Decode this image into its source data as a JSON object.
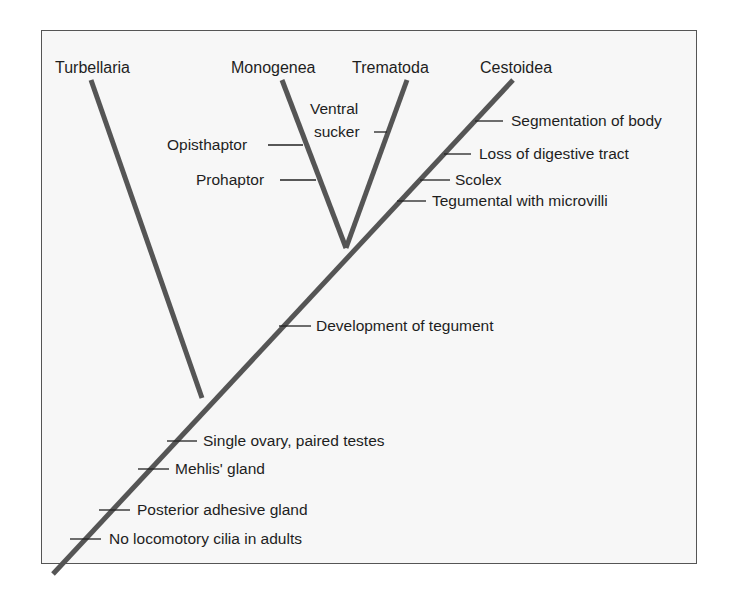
{
  "diagram": {
    "type": "cladogram",
    "colors": {
      "branch": "#555555",
      "tick": "#222222",
      "background": "#f7f7f7",
      "border": "#555555"
    },
    "taxa": [
      {
        "id": "turbellaria",
        "label": "Turbellaria"
      },
      {
        "id": "monogenea",
        "label": "Monogenea"
      },
      {
        "id": "trematoda",
        "label": "Trematoda"
      },
      {
        "id": "cestoidea",
        "label": "Cestoidea"
      }
    ],
    "characters": {
      "ventral_line1": "Ventral",
      "ventral_line2": "sucker",
      "opisthaptor": "Opisthaptor",
      "prohaptor": "Prohaptor",
      "segmentation": "Segmentation of body",
      "loss_digestive": "Loss of digestive tract",
      "scolex": "Scolex",
      "tegumental": "Tegumental with microvilli",
      "development_tegument": "Development of tegument",
      "single_ovary": "Single ovary, paired testes",
      "mehlis": "Mehlis' gland",
      "posterior_adhesive": "Posterior adhesive gland",
      "no_cilia": "No locomotory cilia in adults"
    }
  }
}
